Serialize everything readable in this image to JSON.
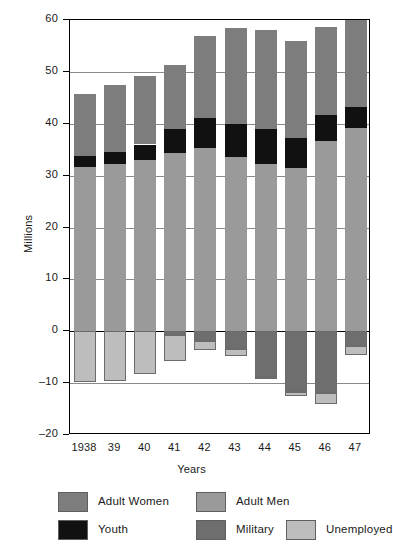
{
  "chart_data": {
    "type": "bar",
    "subtype": "stacked-bar-with-negative",
    "title": "",
    "xlabel": "Years",
    "ylabel": "Millions",
    "ylim": [
      -20,
      60
    ],
    "yticks": [
      60,
      50,
      40,
      30,
      20,
      10,
      0,
      -10,
      -20
    ],
    "ytick_labels": [
      "60",
      "50",
      "40",
      "30",
      "20",
      "10",
      "0",
      "–10",
      "–20"
    ],
    "grid": true,
    "grid_axis": "y",
    "legend_position": "bottom",
    "categories": [
      "1938",
      "39",
      "40",
      "41",
      "42",
      "43",
      "44",
      "45",
      "46",
      "47"
    ],
    "series": [
      {
        "name": "Adult Men",
        "color": "#9a9a9a",
        "sign": "positive",
        "values": [
          31.6,
          32.3,
          33.1,
          34.3,
          35.4,
          33.6,
          32.2,
          31.4,
          36.7,
          39.1
        ]
      },
      {
        "name": "Youth",
        "color": "#111111",
        "sign": "positive",
        "values": [
          2.2,
          2.2,
          2.9,
          4.6,
          5.7,
          6.4,
          6.7,
          5.9,
          5.0,
          4.1
        ]
      },
      {
        "name": "Adult Women",
        "color": "#7d7d7d",
        "sign": "positive",
        "values": [
          11.9,
          12.9,
          13.2,
          12.5,
          15.9,
          18.5,
          19.1,
          18.7,
          16.9,
          16.8
        ]
      },
      {
        "name": "Military",
        "color": "#6e6e6e",
        "sign": "negative",
        "values": [
          0.0,
          0.0,
          0.0,
          0.7,
          1.8,
          3.5,
          8.8,
          11.7,
          11.9,
          2.9
        ]
      },
      {
        "name": "Unemployed",
        "color": "#bdbdbd",
        "sign": "negative",
        "values": [
          9.8,
          9.5,
          8.3,
          5.1,
          1.8,
          1.2,
          0.5,
          0.7,
          2.2,
          1.6
        ]
      }
    ],
    "totals_positive": [
      45.7,
      47.4,
      49.2,
      51.4,
      57.0,
      58.5,
      58.0,
      56.0,
      58.6,
      60.0
    ],
    "totals_negative": [
      -9.8,
      -9.5,
      -8.3,
      -5.8,
      -3.6,
      -4.7,
      -9.3,
      -12.4,
      -14.1,
      -4.5
    ]
  },
  "axes": {
    "y_title": "Millions",
    "x_title": "Years"
  },
  "legend": {
    "items": [
      {
        "label": "Adult Women",
        "color": "#7d7d7d",
        "swatch": "legend-swatch-adult-women"
      },
      {
        "label": "Adult Men",
        "color": "#9a9a9a",
        "swatch": "legend-swatch-adult-men"
      },
      {
        "label": "Youth",
        "color": "#111111",
        "swatch": "legend-swatch-youth"
      },
      {
        "label": "Military",
        "color": "#6e6e6e",
        "swatch": "legend-swatch-military"
      },
      {
        "label": "Unemployed",
        "color": "#bdbdbd",
        "swatch": "legend-swatch-unemployed"
      }
    ]
  },
  "colors": {
    "adult_women": "#7d7d7d",
    "adult_men": "#9a9a9a",
    "youth": "#111111",
    "military": "#6e6e6e",
    "unemployed": "#bdbdbd",
    "axis": "#000000",
    "grid": "#8a8a8a",
    "background": "#ffffff"
  }
}
